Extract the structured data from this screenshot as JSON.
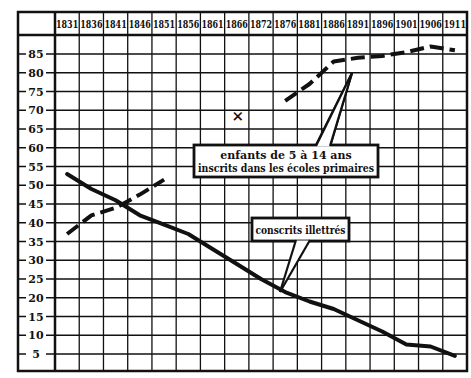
{
  "chart_data": {
    "type": "line",
    "title": "",
    "xlabel": "",
    "ylabel": "",
    "categories": [
      "1831",
      "1836",
      "1841",
      "1846",
      "1851",
      "1856",
      "1861",
      "1866",
      "1872",
      "1876",
      "1881",
      "1886",
      "1891",
      "1896",
      "1901",
      "1906",
      "1911"
    ],
    "y_ticks": [
      5,
      10,
      15,
      20,
      25,
      30,
      35,
      40,
      45,
      50,
      55,
      60,
      65,
      70,
      75,
      80,
      85
    ],
    "ylim": [
      0,
      90
    ],
    "grid": true,
    "legend": "callout annotations",
    "series": [
      {
        "name": "conscrits illettrés",
        "style": "solid",
        "values": [
          53,
          49,
          46,
          42,
          39.5,
          37,
          33,
          29,
          25,
          21.5,
          19,
          17,
          14,
          11,
          7.5,
          7,
          4.5
        ]
      },
      {
        "name": "enfants de 5 à 14 ans inscrits dans les écoles primaires",
        "style": "dashed",
        "values": [
          37,
          42,
          44,
          47.5,
          51.5,
          null,
          null,
          null,
          null,
          72.5,
          77,
          83,
          84,
          84.5,
          85.5,
          87,
          86
        ]
      }
    ],
    "markers": [
      {
        "label": "×",
        "x": "1866",
        "y": 68.5
      }
    ],
    "annotations": [
      {
        "text_lines": [
          "enfants de 5 à 14 ans",
          "inscrits dans les écoles primaires"
        ],
        "points_to": "enfants de 5 à 14 ans inscrits dans les écoles primaires"
      },
      {
        "text_lines": [
          "conscrits illettrés"
        ],
        "points_to": "conscrits illettrés"
      }
    ]
  }
}
